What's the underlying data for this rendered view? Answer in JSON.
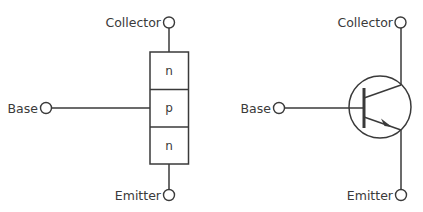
{
  "diagram": {
    "left": {
      "title": "NPN layer structure",
      "labels": {
        "collector": "Collector",
        "base": "Base",
        "emitter": "Emitter"
      },
      "layers": [
        "n",
        "p",
        "n"
      ]
    },
    "right": {
      "title": "NPN transistor symbol",
      "labels": {
        "collector": "Collector",
        "base": "Base",
        "emitter": "Emitter"
      }
    },
    "colors": {
      "stroke": "#3a3a3a",
      "background": "#ffffff"
    }
  }
}
